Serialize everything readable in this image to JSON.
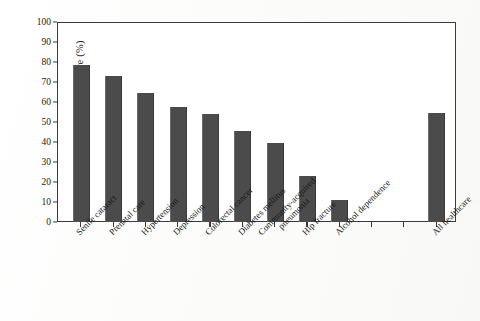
{
  "chart_data": {
    "type": "bar",
    "title": "",
    "xlabel": "",
    "ylabel": "Receipt of recommended care (%)",
    "ylim": [
      0,
      100
    ],
    "ytick_step": 10,
    "yticks": [
      "100",
      "90",
      "80",
      "70",
      "60",
      "50",
      "40",
      "30",
      "20",
      "10",
      "0"
    ],
    "grid": false,
    "legend": "none",
    "bar_color": "#4b4b4b",
    "axis_color": "#3b3b3b",
    "background_color": "#ffffff",
    "categories": [
      "Senile cataract",
      "Prenatal care",
      "Hypertension",
      "Depression",
      "Colorectal cancer",
      "Diabetes mellitus",
      "Community-acquired\npneumonia",
      "Hip fracture",
      "Alcohol dependence",
      "All healthcare"
    ],
    "values": [
      78.7,
      73.0,
      64.5,
      57.5,
      54.0,
      45.5,
      39.5,
      23.0,
      11.0,
      54.5
    ],
    "gap_before_last_category": true
  }
}
